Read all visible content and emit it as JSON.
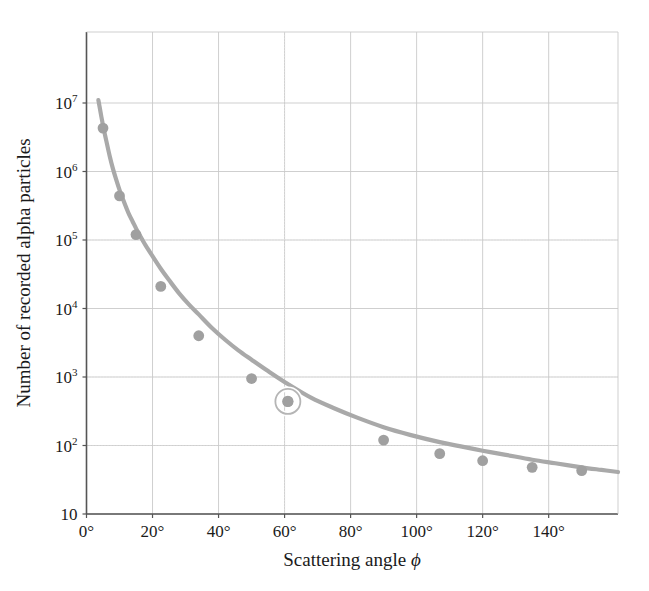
{
  "chart_data": {
    "type": "line",
    "title": "",
    "xlabel": "Scattering angle ϕ",
    "ylabel": "Number of recorded alpha particles",
    "yscale": "log",
    "xscale": "linear",
    "xlim": [
      0,
      161
    ],
    "ylim": [
      10,
      18000000
    ],
    "grid": true,
    "legend": null,
    "x": [
      5,
      10,
      15,
      22.5,
      34,
      50,
      61,
      90,
      107,
      120,
      135,
      150
    ],
    "values": [
      4300000,
      440000,
      120000,
      21000,
      4000,
      950,
      440,
      120,
      76,
      60,
      48,
      43
    ],
    "series": [
      {
        "name": "Recorded alpha particles",
        "x": [
          5,
          10,
          15,
          22.5,
          34,
          50,
          61,
          90,
          107,
          120,
          135,
          150
        ],
        "values": [
          4300000,
          440000,
          120000,
          21000,
          4000,
          950,
          440,
          120,
          76,
          60,
          48,
          43
        ]
      }
    ],
    "curve_x": [
      3.6,
      4,
      4.5,
      5,
      5.5,
      6,
      7,
      8,
      9,
      10,
      11,
      12,
      13,
      14,
      15,
      16,
      17,
      18,
      20,
      22.5,
      25,
      28,
      31,
      34,
      38,
      42,
      46,
      50,
      55,
      61,
      68,
      75,
      82,
      90,
      98,
      107,
      113,
      120,
      127,
      135,
      142,
      150,
      156,
      161
    ],
    "curve_y": [
      11000000,
      8600000,
      6300000,
      4700000,
      3600000,
      2800000,
      1700000,
      1100000,
      760000,
      540000,
      400000,
      300000,
      230000,
      185000,
      148000,
      120000,
      99000,
      82000,
      58000,
      38000,
      26000,
      16800,
      11500,
      8200,
      5200,
      3500,
      2450,
      1790,
      1220,
      790,
      500,
      350,
      255,
      185,
      143,
      112,
      98,
      84,
      73,
      62,
      55,
      48,
      44,
      41
    ],
    "highlight": {
      "x": 61,
      "y": 440,
      "shape": "ring"
    },
    "colors": {
      "curve": "#a9a9a9",
      "marker": "#a0a0a0",
      "highlight_ring": "#b5b5b5",
      "grid": "#c9c9c9",
      "grid_minor": "#dedede",
      "axis": "#555555",
      "text": "#1a1a1a",
      "background": "#ffffff"
    },
    "xticks": [
      {
        "value": 0,
        "label": "0",
        "suffix": "°"
      },
      {
        "value": 20,
        "label": "20",
        "suffix": "°"
      },
      {
        "value": 40,
        "label": "40",
        "suffix": "°"
      },
      {
        "value": 60,
        "label": "60",
        "suffix": "°"
      },
      {
        "value": 80,
        "label": "80",
        "suffix": "°"
      },
      {
        "value": 100,
        "label": "100",
        "suffix": "°"
      },
      {
        "value": 120,
        "label": "120",
        "suffix": "°"
      },
      {
        "value": 140,
        "label": "140",
        "suffix": "°"
      }
    ],
    "yticks": [
      {
        "value": 10000000,
        "mantissa": "10",
        "exponent": "7"
      },
      {
        "value": 1000000,
        "mantissa": "10",
        "exponent": "6"
      },
      {
        "value": 100000,
        "mantissa": "10",
        "exponent": "5"
      },
      {
        "value": 10000,
        "mantissa": "10",
        "exponent": "4"
      },
      {
        "value": 1000,
        "mantissa": "10",
        "exponent": "3"
      },
      {
        "value": 100,
        "mantissa": "10",
        "exponent": "2"
      },
      {
        "value": 10,
        "mantissa": "10",
        "exponent": ""
      }
    ]
  }
}
